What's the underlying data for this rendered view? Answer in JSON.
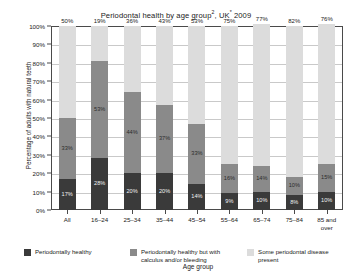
{
  "chart_data": {
    "type": "bar",
    "subtype": "stacked-bar-100",
    "xlabel": "Age group",
    "ylabel": "Percentage of adults with natural teeth",
    "ylim": [
      0,
      100
    ],
    "yticks": [
      "0%",
      "10%",
      "20%",
      "30%",
      "40%",
      "50%",
      "60%",
      "70%",
      "80%",
      "90%",
      "100%"
    ],
    "ytick_values": [
      0,
      10,
      20,
      30,
      40,
      50,
      60,
      70,
      80,
      90,
      100
    ],
    "grid": true,
    "legend_position": "bottom",
    "categories": [
      "All",
      "16–24",
      "25–34",
      "35–44",
      "45–54",
      "55–64",
      "65–74",
      "75–84",
      "85 and over"
    ],
    "series": [
      {
        "name": "Periodontally healthy",
        "color": "#3a3a3a",
        "values": [
          17,
          28,
          20,
          20,
          14,
          9,
          10,
          8,
          10
        ],
        "labels": [
          "17%",
          "28%",
          "20%",
          "20%",
          "14%",
          "9%",
          "10%",
          "8%",
          "10%"
        ]
      },
      {
        "name": "Periodontally healthy but with calculus and/or bleeding",
        "color": "#8a8a8a",
        "values": [
          33,
          53,
          44,
          37,
          33,
          16,
          14,
          10,
          15
        ],
        "labels": [
          "33%",
          "53%",
          "44%",
          "37%",
          "33%",
          "16%",
          "14%",
          "10%",
          "15%"
        ]
      },
      {
        "name": "Some periodontal disease present",
        "color": "#dcdcdc",
        "values": [
          50,
          19,
          36,
          43,
          53,
          75,
          77,
          82,
          76
        ],
        "labels": [
          "50%",
          "19%",
          "36%",
          "43%",
          "53%",
          "75%",
          "77%",
          "82%",
          "76%"
        ]
      }
    ]
  },
  "colors": {
    "healthy": "#3a3a3a",
    "calculus": "#8a8a8a",
    "disease": "#dcdcdc",
    "axis": "#4a4a4a",
    "grid": "#c9c9c9",
    "background": "#ffffff"
  }
}
